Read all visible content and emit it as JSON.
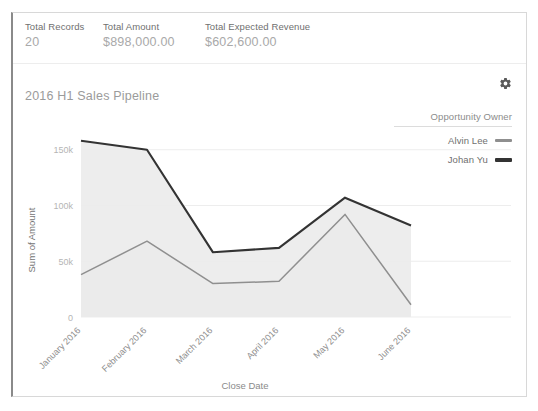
{
  "summary": {
    "metrics": [
      {
        "label": "Total Records",
        "value": "20"
      },
      {
        "label": "Total Amount",
        "value": "$898,000.00"
      },
      {
        "label": "Total Expected Revenue",
        "value": "$602,600.00"
      }
    ]
  },
  "chart_card": {
    "title": "2016 H1 Sales Pipeline",
    "settings_icon": "gear-icon"
  },
  "legend": {
    "title": "Opportunity Owner",
    "items": [
      {
        "label": "Alvin Lee",
        "color": "#8f8f8f"
      },
      {
        "label": "Johan Yu",
        "color": "#333333"
      }
    ]
  },
  "chart_data": {
    "type": "line",
    "title": "2016 H1 Sales Pipeline",
    "xlabel": "Close Date",
    "ylabel": "Sum of Amount",
    "categories": [
      "January 2016",
      "February 2016",
      "March 2016",
      "April 2016",
      "May 2016",
      "June 2016"
    ],
    "ytick_labels": [
      "0",
      "50k",
      "100k",
      "150k"
    ],
    "ytick_values": [
      0,
      50000,
      100000,
      150000
    ],
    "ylim": [
      0,
      165000
    ],
    "grid": true,
    "legend_position": "right",
    "area_fill": true,
    "series": [
      {
        "name": "Alvin Lee",
        "color": "#8f8f8f",
        "values": [
          38000,
          68000,
          30000,
          32000,
          92000,
          11000
        ]
      },
      {
        "name": "Johan Yu",
        "color": "#333333",
        "values": [
          158000,
          150000,
          58000,
          62000,
          107000,
          82000
        ]
      }
    ]
  }
}
